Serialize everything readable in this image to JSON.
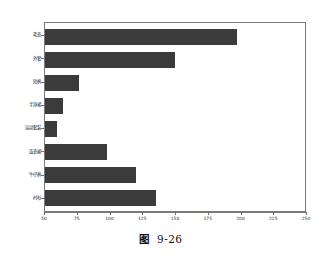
{
  "chart_data": {
    "type": "bar",
    "orientation": "horizontal",
    "title": "",
    "xlabel": "",
    "ylabel": "",
    "xlim": [
      50,
      250
    ],
    "xticks": [
      50,
      75,
      100,
      125,
      150,
      175,
      200,
      225,
      250
    ],
    "grid": false,
    "legend": null,
    "bar_color": "#3b3b3b",
    "categories": [
      "毛衣",
      "外套",
      "短裤",
      "半身裙",
      "运动套装",
      "连衣裙",
      "牛仔裤",
      "衬衫"
    ],
    "values": [
      198,
      150,
      76,
      64,
      59,
      98,
      120,
      135
    ]
  },
  "caption": {
    "label": "图",
    "number": "9-26"
  }
}
